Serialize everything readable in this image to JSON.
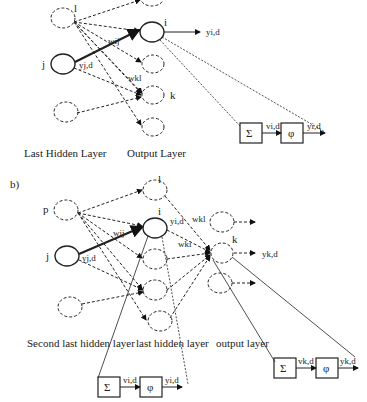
{
  "panel_a": {
    "nodes": {
      "l": "l",
      "i": "i",
      "j": "j",
      "k": "k"
    },
    "labels": {
      "w_ij": "wij",
      "w_kl": "wkl",
      "y_jd": "yj,d",
      "y_id": "yi,d"
    },
    "block": {
      "sum": "Σ",
      "v": "vi,d",
      "phi": "φ",
      "y": "yi,d"
    },
    "captions": {
      "left": "Last Hidden Layer",
      "right": "Output Layer"
    }
  },
  "panel_b": {
    "tag": "b)",
    "nodes": {
      "p": "p",
      "l": "l",
      "i": "i",
      "j": "j",
      "k": "k"
    },
    "labels": {
      "w_ij": "wij",
      "w_kl_top": "wkl",
      "w_ki": "wki",
      "y_jd": "yj,d",
      "y_id": "yi,d",
      "y_kd": "yk,d"
    },
    "block_i": {
      "sum": "Σ",
      "v": "vi,d",
      "phi": "φ",
      "y": "yi,d"
    },
    "block_k": {
      "sum": "Σ",
      "v": "vk,d",
      "phi": "φ",
      "y": "yk,d"
    },
    "captions": {
      "left": "Second last hidden layer",
      "middle": "last hidden layer",
      "right": "output layer"
    }
  }
}
